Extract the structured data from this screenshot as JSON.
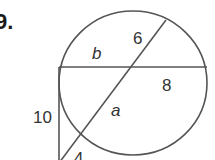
{
  "problem": {
    "number": "9."
  },
  "diagram": {
    "stroke_color": "#555555",
    "text_color": "#333333",
    "labels": {
      "b": "b",
      "six": "6",
      "eight": "8",
      "a": "a",
      "ten": "10",
      "four": "4"
    }
  }
}
